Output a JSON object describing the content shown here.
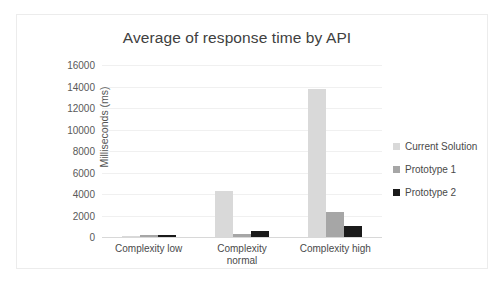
{
  "chart_data": {
    "type": "bar",
    "title": "Average of response time by API",
    "xlabel": "",
    "ylabel": "Milliseconds (ms)",
    "categories": [
      "Complexity low",
      "Complexity normal",
      "Complexity high"
    ],
    "category_lines": [
      [
        "Complexity low"
      ],
      [
        "Complexity",
        "normal"
      ],
      [
        "Complexity high"
      ]
    ],
    "series": [
      {
        "name": "Current Solution",
        "color": "#d9d9d9",
        "values": [
          120,
          4300,
          13800
        ]
      },
      {
        "name": "Prototype 1",
        "color": "#a6a6a6",
        "values": [
          150,
          250,
          2300
        ]
      },
      {
        "name": "Prototype 2",
        "color": "#1a1a1a",
        "values": [
          200,
          600,
          1000
        ]
      }
    ],
    "ylim": [
      0,
      16000
    ],
    "ytick_step": 2000,
    "yticks": [
      16000,
      14000,
      12000,
      10000,
      8000,
      6000,
      4000,
      2000,
      0
    ],
    "ytick_labels": [
      "16000",
      "14000",
      "12000",
      "10000",
      "8000",
      "6000",
      "4000",
      "2000",
      "0"
    ],
    "grid": true,
    "legend_position": "right"
  }
}
